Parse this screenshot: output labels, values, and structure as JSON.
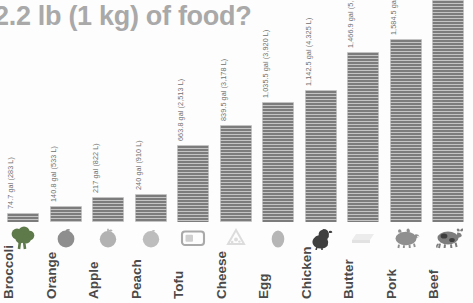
{
  "chart_data": {
    "type": "bar",
    "title": "2.2 lb (1 kg) of food?",
    "xlabel": "",
    "ylabel": "",
    "grid": false,
    "legend": false,
    "unit_primary": "gal",
    "unit_secondary": "L",
    "note": "Beef bar is cropped at the top of the frame; its value label is not visible.",
    "categories": [
      "Broccoli",
      "Orange",
      "Apple",
      "Peach",
      "Tofu",
      "Cheese",
      "Egg",
      "Chicken",
      "Butter",
      "Pork",
      "Beef"
    ],
    "values": [
      74.7,
      140.8,
      217,
      240,
      663.8,
      839.5,
      1035.5,
      1142.5,
      1466.9,
      1584.5,
      null
    ],
    "values_liters": [
      283,
      533,
      822,
      910,
      2513,
      3178,
      3920,
      4325,
      5553,
      5998,
      null
    ],
    "bars": [
      {
        "label": "Broccoli",
        "value_label": "74.7 gal (283 L)",
        "icon": "broccoli-icon",
        "bar_height_px": 9,
        "cropped": false
      },
      {
        "label": "Orange",
        "value_label": "140.8 gal (533 L)",
        "icon": "orange-icon",
        "bar_height_px": 16,
        "cropped": false
      },
      {
        "label": "Apple",
        "value_label": "217 gal (822 L)",
        "icon": "apple-icon",
        "bar_height_px": 25,
        "cropped": false
      },
      {
        "label": "Peach",
        "value_label": "240 gal (910 L)",
        "icon": "peach-icon",
        "bar_height_px": 28,
        "cropped": false
      },
      {
        "label": "Tofu",
        "value_label": "663.8 gal (2,513 L)",
        "icon": "tofu-icon",
        "bar_height_px": 77,
        "cropped": false
      },
      {
        "label": "Cheese",
        "value_label": "839.5 gal (3,178 L)",
        "icon": "cheese-icon",
        "bar_height_px": 97,
        "cropped": false
      },
      {
        "label": "Egg",
        "value_label": "1,035.5 gal (3,920 L)",
        "icon": "egg-icon",
        "bar_height_px": 120,
        "cropped": false
      },
      {
        "label": "Chicken",
        "value_label": "1,142.5 gal (4,325 L)",
        "icon": "chicken-icon",
        "bar_height_px": 132,
        "cropped": false
      },
      {
        "label": "Butter",
        "value_label": "1,466.9 gal (5,553 L)",
        "icon": "butter-icon",
        "bar_height_px": 170,
        "cropped": false
      },
      {
        "label": "Pork",
        "value_label": "1,584.5 gal (5,998 L)",
        "icon": "pork-icon",
        "bar_height_px": 183,
        "cropped": false
      },
      {
        "label": "Beef",
        "value_label": "",
        "icon": "beef-icon",
        "bar_height_px": 303,
        "cropped": true
      }
    ]
  },
  "colors": {
    "background": "#fdfdfd",
    "bar": "#7c7c7c",
    "title": "#a9a9a9",
    "value_label": "#6f6f6f",
    "category_label": "#4a4a4a",
    "icon_dark": "#5f7a4a",
    "icon_mid": "#8c8c8c",
    "icon_light": "#d6d6d6"
  }
}
